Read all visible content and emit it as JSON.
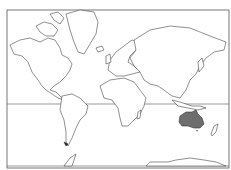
{
  "map": {
    "type": "world-outline-mercator",
    "highlighted_region": "Australia",
    "highlight_color": "#6e6e6e",
    "outline_color": "#444444",
    "background_color": "#ffffff",
    "equator_line": true
  }
}
